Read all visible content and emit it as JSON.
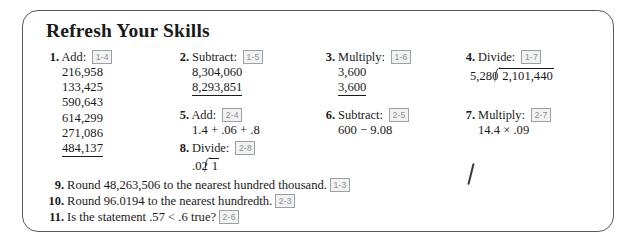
{
  "worksheet": {
    "title": "Refresh Your Skills",
    "problems": [
      {
        "number": "1.",
        "verb": "Add:",
        "tag": "1-4",
        "kind": "stack",
        "operands": [
          "216,958",
          "133,425",
          "590,643",
          "614,299",
          "271,086"
        ],
        "last_operand": "484,137"
      },
      {
        "number": "2.",
        "verb": "Subtract:",
        "tag": "1-5",
        "kind": "stack",
        "operands": [
          "8,304,060"
        ],
        "last_operand": "8,293,851"
      },
      {
        "number": "3.",
        "verb": "Multiply:",
        "tag": "1-6",
        "kind": "stack",
        "operands": [
          "3,600"
        ],
        "last_operand": "3,600"
      },
      {
        "number": "4.",
        "verb": "Divide:",
        "tag": "1-7",
        "kind": "divide",
        "divisor": "5,280",
        "dividend": "2,101,440"
      },
      {
        "number": "5.",
        "verb": "Add:",
        "tag": "2-4",
        "kind": "expr",
        "expression": "1.4 + .06 + .8"
      },
      {
        "number": "6.",
        "verb": "Subtract:",
        "tag": "2-5",
        "kind": "expr",
        "expression": "600 − 9.08"
      },
      {
        "number": "7.",
        "verb": "Multiply:",
        "tag": "2-7",
        "kind": "expr",
        "expression": "14.4 × .09"
      },
      {
        "number": "8.",
        "verb": "Divide:",
        "tag": "2-8",
        "kind": "divide",
        "divisor": ".02",
        "dividend": "1"
      }
    ],
    "questions": [
      {
        "number": "9.",
        "text": "Round 48,263,506 to the nearest hundred thousand.",
        "tag": "1-3"
      },
      {
        "number": "10.",
        "text": "Round 96.0194 to the nearest hundredth.",
        "tag": "2-3"
      },
      {
        "number": "11.",
        "text": "Is the statement .57 < .6 true?",
        "tag": "2-6"
      }
    ]
  },
  "colors": {
    "ink": "#1a1a1a",
    "border": "#555b60",
    "tag_text": "#8a9096",
    "tag_fill": "#f2f2f2"
  }
}
